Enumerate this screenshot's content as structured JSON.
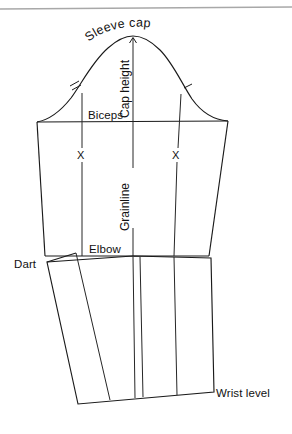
{
  "document": {
    "kind": "sewing-pattern-diagram",
    "subject": "Two-piece tailored sleeve block",
    "background_color": "#ffffff",
    "line_color": "#1a1a1a",
    "header_rule_color": "#a8a8a8"
  },
  "labels": {
    "sleeve_cap": "Sleeve cap",
    "cap_height": "Cap height",
    "biceps": "Biceps",
    "grainline": "Grainline",
    "elbow": "Elbow",
    "dart": "Dart",
    "wrist_level": "Wrist level",
    "x_left": "X",
    "x_right": "X"
  },
  "annotations": {
    "notch_left": "cross-tick-notch",
    "notch_right": "single-tick-notch",
    "cap_height_arrowhead": "up-arrow"
  }
}
